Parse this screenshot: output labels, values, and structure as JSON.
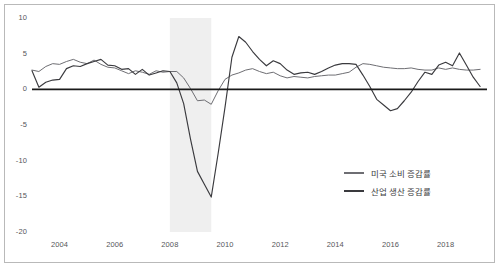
{
  "chart_data": {
    "type": "line",
    "title": "",
    "subtitle": "",
    "xlabel": "",
    "ylabel": "",
    "xlim": [
      2003.0,
      2019.5
    ],
    "ylim": [
      -20,
      10
    ],
    "grid": false,
    "legend_position": "lower-right",
    "y_ticks": [
      "10",
      "5",
      "0",
      "-5",
      "-10",
      "-15",
      "-20"
    ],
    "y_tick_values": [
      10,
      5,
      0,
      -5,
      -10,
      -15,
      -20
    ],
    "x_ticks": [
      "2004",
      "2006",
      "2008",
      "2010",
      "2012",
      "2014",
      "2016",
      "2018"
    ],
    "x_tick_values": [
      2004,
      2006,
      2008,
      2010,
      2012,
      2014,
      2016,
      2018
    ],
    "zero_line": 0,
    "shaded_regions": [
      {
        "name": "recession-band",
        "x_start": 2008.0,
        "x_end": 2009.5,
        "color": "#efefef"
      }
    ],
    "series": [
      {
        "name": "미국 소비 증감률",
        "color": "#6e6e73",
        "x": [
          2003.0,
          2003.25,
          2003.5,
          2003.75,
          2004.0,
          2004.25,
          2004.5,
          2004.75,
          2005.0,
          2005.25,
          2005.5,
          2005.75,
          2006.0,
          2006.25,
          2006.5,
          2006.75,
          2007.0,
          2007.25,
          2007.5,
          2007.75,
          2008.0,
          2008.25,
          2008.5,
          2008.75,
          2009.0,
          2009.25,
          2009.5,
          2009.75,
          2010.0,
          2010.25,
          2010.5,
          2010.75,
          2011.0,
          2011.25,
          2011.5,
          2011.75,
          2012.0,
          2012.25,
          2012.5,
          2012.75,
          2013.0,
          2013.25,
          2013.5,
          2013.75,
          2014.0,
          2014.25,
          2014.5,
          2014.75,
          2015.0,
          2015.25,
          2015.5,
          2015.75,
          2016.0,
          2016.25,
          2016.5,
          2016.75,
          2017.0,
          2017.25,
          2017.5,
          2017.75,
          2018.0,
          2018.25,
          2018.5,
          2018.75,
          2019.0,
          2019.25
        ],
        "values": [
          2.7,
          2.5,
          3.2,
          3.6,
          3.5,
          3.9,
          4.2,
          3.8,
          3.6,
          4.1,
          3.5,
          3.1,
          3.0,
          2.6,
          2.2,
          2.6,
          2.4,
          2.1,
          2.6,
          2.4,
          2.5,
          2.5,
          1.6,
          0.1,
          -1.6,
          -1.5,
          -2.1,
          -0.2,
          1.4,
          2.0,
          2.3,
          2.7,
          2.9,
          2.5,
          2.2,
          2.4,
          1.9,
          1.6,
          1.8,
          1.7,
          1.6,
          1.8,
          1.9,
          2.0,
          2.0,
          2.2,
          2.4,
          3.1,
          3.6,
          3.5,
          3.3,
          3.1,
          3.0,
          2.9,
          2.9,
          3.0,
          2.8,
          2.7,
          2.7,
          3.0,
          2.8,
          3.0,
          2.8,
          2.7,
          2.7,
          2.8
        ]
      },
      {
        "name": "산업 생산 증감률",
        "color": "#3a3a3e",
        "x": [
          2003.0,
          2003.25,
          2003.5,
          2003.75,
          2004.0,
          2004.25,
          2004.5,
          2004.75,
          2005.0,
          2005.25,
          2005.5,
          2005.75,
          2006.0,
          2006.25,
          2006.5,
          2006.75,
          2007.0,
          2007.25,
          2007.5,
          2007.75,
          2008.0,
          2008.25,
          2008.5,
          2008.75,
          2009.0,
          2009.25,
          2009.5,
          2009.75,
          2010.0,
          2010.25,
          2010.5,
          2010.75,
          2011.0,
          2011.25,
          2011.5,
          2011.75,
          2012.0,
          2012.25,
          2012.5,
          2012.75,
          2013.0,
          2013.25,
          2013.5,
          2013.75,
          2014.0,
          2014.25,
          2014.5,
          2014.75,
          2015.0,
          2015.25,
          2015.5,
          2015.75,
          2016.0,
          2016.25,
          2016.5,
          2016.75,
          2017.0,
          2017.25,
          2017.5,
          2017.75,
          2018.0,
          2018.25,
          2018.5,
          2018.75,
          2019.0,
          2019.25
        ],
        "values": [
          2.6,
          0.3,
          1.0,
          1.3,
          1.4,
          2.9,
          3.3,
          3.2,
          3.6,
          3.9,
          4.2,
          3.4,
          3.3,
          2.8,
          2.9,
          2.1,
          2.8,
          2.0,
          2.3,
          2.6,
          2.5,
          0.9,
          -2.0,
          -7.0,
          -11.5,
          -13.3,
          -15.1,
          -9.0,
          -2.5,
          4.5,
          7.4,
          6.6,
          5.3,
          4.2,
          3.3,
          4.0,
          3.6,
          2.7,
          2.1,
          2.3,
          2.4,
          2.1,
          2.5,
          3.0,
          3.4,
          3.6,
          3.6,
          3.5,
          2.0,
          0.4,
          -1.4,
          -2.2,
          -3.0,
          -2.7,
          -1.6,
          -0.4,
          1.1,
          2.4,
          2.1,
          3.4,
          3.8,
          3.3,
          5.1,
          3.4,
          1.7,
          0.4
        ]
      }
    ]
  },
  "legend": {
    "items": [
      {
        "label": "미국 소비 증감률",
        "color": "#6e6e73"
      },
      {
        "label": "산업 생산 증감률",
        "color": "#3a3a3e"
      }
    ]
  },
  "axis": {
    "y_labels": [
      "10",
      "5",
      "0",
      "-5",
      "-10",
      "-15",
      "-20"
    ],
    "x_labels": [
      "2004",
      "2006",
      "2008",
      "2010",
      "2012",
      "2014",
      "2016",
      "2018"
    ]
  }
}
